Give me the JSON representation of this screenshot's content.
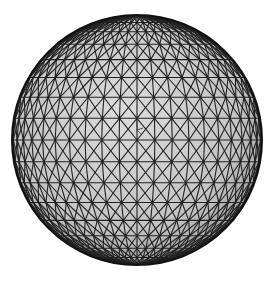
{
  "figure": {
    "type": "wireframe-sphere",
    "center": [
      137,
      140
    ],
    "radius": 125,
    "meridians": 22,
    "parallels": 18,
    "diagonals": true,
    "colors": {
      "background": "#ffffff",
      "fill_light": "#d8d8d8",
      "fill_dark": "#a8a8a8",
      "line": "#202020",
      "rim": "#111111"
    },
    "axis_marker": {
      "visible": true,
      "position": [
        137,
        130
      ]
    }
  }
}
